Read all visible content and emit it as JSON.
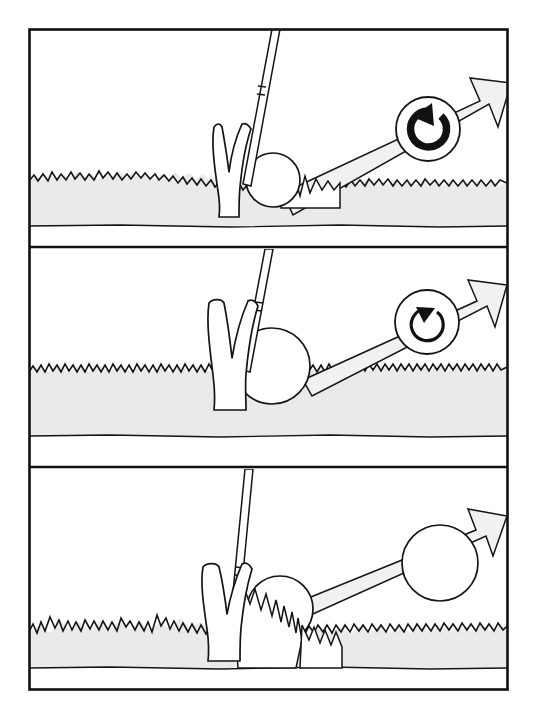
{
  "figure": {
    "title": "Golf ball lie and backspin comparison",
    "description": "Three-panel line illustration showing how the lie of a golf ball in grass affects backspin and launch.",
    "panel_count": 3,
    "colors": {
      "ink": "#141414",
      "ground_fill": "#eaeaea",
      "arrow_fill": "#f1f1f1",
      "ball_fill": "#ffffff",
      "page_background": "#ffffff"
    },
    "frame": {
      "border_color": "#111111",
      "border_width_px": 2.6
    }
  },
  "panels": [
    {
      "id": "panel-1",
      "index": 1,
      "caption": "Ball sitting down on a tight lie",
      "lie": "tight lie on fairway",
      "spin_indicator": {
        "present": true,
        "direction": "counterclockwise",
        "meaning": "full backspin",
        "weight": "heavy",
        "arc_sweep_degrees": 290,
        "arrowhead": "thick hooked head"
      },
      "launch_arrow": {
        "present": true,
        "direction": "up and to the right",
        "angle_degrees": 18,
        "fill": "#f1f1f1"
      },
      "ball": {
        "present": true,
        "state": "resting on turf, contacting club face"
      },
      "club": {
        "present": true,
        "type": "iron",
        "position": "behind ball at impact"
      },
      "grass": {
        "height": "short",
        "density": "low"
      }
    },
    {
      "id": "panel-2",
      "index": 2,
      "caption": "Ball sitting up slightly in light grass",
      "lie": "ball sitting up in light grass",
      "spin_indicator": {
        "present": true,
        "direction": "counterclockwise",
        "meaning": "reduced backspin",
        "weight": "light",
        "arc_sweep_degrees": 250,
        "arrowhead": "small triangular head"
      },
      "launch_arrow": {
        "present": true,
        "direction": "up and to the right",
        "angle_degrees": 16,
        "fill": "#f1f1f1"
      },
      "ball": {
        "present": true,
        "state": "sitting up on top of the grass"
      },
      "club": {
        "present": true,
        "type": "iron",
        "position": "sliding under ball"
      },
      "grass": {
        "height": "medium",
        "density": "medium"
      }
    },
    {
      "id": "panel-3",
      "index": 3,
      "caption": "Ball buried in heavy rough",
      "lie": "ball buried in thick rough",
      "spin_indicator": {
        "present": false,
        "direction": "none",
        "meaning": "no backspin, flyer lie",
        "weight": "none",
        "arc_sweep_degrees": 0,
        "arrowhead": "none"
      },
      "launch_arrow": {
        "present": true,
        "direction": "up and to the right",
        "angle_degrees": 15,
        "fill": "#f1f1f1"
      },
      "ball": {
        "present": true,
        "state": "nested down in long grass with tufts around it"
      },
      "club": {
        "present": true,
        "type": "iron",
        "position": "entering the rough behind the ball"
      },
      "grass": {
        "height": "long",
        "density": "heavy"
      }
    }
  ]
}
